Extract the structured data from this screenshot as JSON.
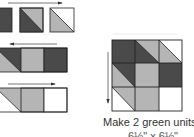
{
  "colors": {
    "dark": "#4a4a4a",
    "light": "#b5b5b5",
    "white": "#ffffff",
    "stroke": "#222222",
    "arrow": "#333333"
  },
  "caption": {
    "line1": "Make 2 green units,",
    "line2": "6½\" x 6½\""
  },
  "strips": [
    {
      "arrow": "right",
      "cells": [
        "dark",
        "dark-light-diag",
        "light-white-diag"
      ]
    },
    {
      "arrow": "left",
      "cells": [
        "light-dark-diag",
        "light",
        "dark"
      ]
    },
    {
      "arrow": "right",
      "cells": [
        "light-white-diag",
        "light",
        "white"
      ]
    }
  ],
  "grid": {
    "arrow": "down",
    "rows": [
      [
        "dark",
        "dark-light-diag",
        "light-white-diag"
      ],
      [
        "light-dark-diag",
        "light",
        "dark"
      ],
      [
        "light-white-diag",
        "light",
        "white"
      ]
    ]
  }
}
